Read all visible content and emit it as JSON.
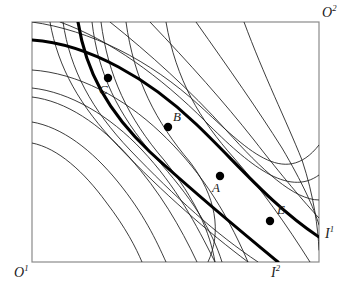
{
  "figure": {
    "type": "edgeworth-box",
    "box": {
      "x": 32,
      "y": 22,
      "width": 287,
      "height": 240
    },
    "stroke_color": "#1a1a1a",
    "box_border_color": "#8a8a8a",
    "background": "#ffffff"
  },
  "corners": {
    "origin1": {
      "base": "O",
      "sup": "1",
      "x": 14,
      "y": 264
    },
    "origin2": {
      "base": "O",
      "sup": "2",
      "x": 322,
      "y": 4
    }
  },
  "endpoints": {
    "i1": {
      "base": "I",
      "sup": "1",
      "x": 325,
      "y": 225
    },
    "i2": {
      "base": "I",
      "sup": "2",
      "x": 271,
      "y": 264
    }
  },
  "points": [
    {
      "id": "C",
      "label": "C",
      "cx": 108,
      "cy": 78,
      "lx": 99,
      "ly": 83,
      "r": 4.2
    },
    {
      "id": "B",
      "label": "B",
      "cx": 168,
      "cy": 127,
      "lx": 173,
      "ly": 110,
      "r": 4.2
    },
    {
      "id": "A",
      "label": "A",
      "cx": 220,
      "cy": 176,
      "lx": 212,
      "ly": 181,
      "r": 4.2
    },
    {
      "id": "E",
      "label": "E",
      "cx": 270,
      "cy": 221,
      "lx": 277,
      "ly": 203,
      "r": 4.2
    }
  ],
  "chart_data": {
    "type": "line",
    "title": "",
    "xlabel": "",
    "ylabel": "",
    "grid": false,
    "legend": "none",
    "annotations": [
      "O1",
      "O2",
      "I1",
      "I2",
      "A",
      "B",
      "C",
      "E"
    ],
    "series": [
      {
        "name": "agent1-indifference-thick-I1",
        "weight": "thick",
        "path": "M 32,40 C 90,44 150,80 196,124 C 236,162 272,206 319,237"
      },
      {
        "name": "agent2-indifference-thick-I2",
        "weight": "thick",
        "path": "M 78,22 C 86,72 108,112 150,152 C 200,198 242,232 278,262"
      },
      {
        "name": "agent1-ic-1",
        "weight": "thin",
        "path": "M 32,70 C 78,73 124,98 160,132 C 196,166 224,206 248,262"
      },
      {
        "name": "agent1-ic-2",
        "weight": "thin",
        "path": "M 32,88 C 70,92 110,116 142,150 C 176,186 196,224 215,262"
      },
      {
        "name": "agent1-ic-3",
        "weight": "thin",
        "path": "M 32,97 C 66,101 100,124 130,158 C 160,192 180,226 197,262"
      },
      {
        "name": "agent1-ic-4",
        "weight": "thin",
        "path": "M 32,122 C 62,127 92,150 118,182 C 144,214 156,240 166,262"
      },
      {
        "name": "agent1-ic-5",
        "weight": "thin",
        "path": "M 32,143 C 58,148 84,172 106,202 C 126,228 136,248 142,262"
      },
      {
        "name": "agent2-ic-1",
        "weight": "thin",
        "path": "M 50,22 C 58,68 80,106 118,146 C 164,194 208,232 248,262"
      },
      {
        "name": "agent2-ic-2",
        "weight": "thin",
        "path": "M 63,22 C 70,70 92,110 130,150 C 176,198 216,234 258,262"
      },
      {
        "name": "agent2-ic-3",
        "weight": "thin",
        "path": "M 92,22 C 98,74 118,114 154,156 C 192,198 212,230 222,262"
      },
      {
        "name": "agent2-ic-4",
        "weight": "thin",
        "path": "M 101,22 C 108,76 128,118 164,160 C 196,200 210,232 215,262"
      },
      {
        "name": "agent2-ic-5",
        "weight": "thin",
        "path": "M 126,22 C 134,80 156,122 190,162 C 216,196 222,232 208,262"
      },
      {
        "name": "agent2-ic-6",
        "weight": "thin",
        "path": "M 166,22 C 176,80 200,120 234,158 C 262,190 286,224 310,262"
      },
      {
        "name": "agent1-ic-upper-1",
        "weight": "thin",
        "path": "M 32,22 C 90,30 150,60 200,106 C 246,148 284,190 319,145"
      },
      {
        "name": "agent1-ic-upper-2",
        "weight": "thin",
        "path": "M 60,22 C 110,40 160,76 206,122 C 248,164 288,198 319,175"
      },
      {
        "name": "agent1-ic-upper-3",
        "weight": "thin",
        "path": "M 110,22 C 150,54 190,90 226,130 C 262,170 294,200 319,200"
      },
      {
        "name": "agent1-ic-right-1",
        "weight": "thin",
        "path": "M 150,22 C 190,64 224,102 254,140 C 282,176 304,202 319,218"
      },
      {
        "name": "agent1-ic-right-2",
        "weight": "thin",
        "path": "M 196,22 C 230,70 258,110 282,148 C 302,182 314,208 319,225"
      },
      {
        "name": "agent2-ic-right-edge",
        "weight": "thin",
        "path": "M 244,22 C 264,76 286,120 302,160 C 314,196 318,228 319,250"
      }
    ]
  }
}
